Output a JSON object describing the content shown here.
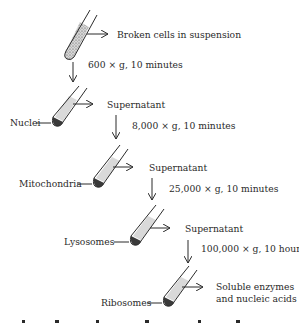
{
  "diagram": {
    "start": {
      "label": "Broken cells in suspension"
    },
    "steps": [
      {
        "condition": "600 × g, 10 minutes",
        "pellet": "Nuclei",
        "supernatant": "Supernatant"
      },
      {
        "condition": "8,000 × g, 10 minutes",
        "pellet": "Mitochondria",
        "supernatant": "Supernatant"
      },
      {
        "condition": "25,000 × g, 10 minutes",
        "pellet": "Lysosomes",
        "supernatant": "Supernatant"
      },
      {
        "condition": "100,000 × g, 10 hours",
        "pellet": "Ribosomes",
        "supernatant_line1": "Soluble enzymes",
        "supernatant_line2": "and nucleic acids"
      }
    ],
    "colors": {
      "ink": "#2b2b2b",
      "liquid": "#d9d9d9",
      "background": "#ffffff"
    }
  }
}
